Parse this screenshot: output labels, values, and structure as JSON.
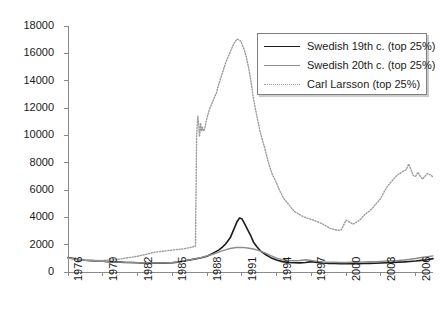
{
  "chart_data": {
    "type": "line",
    "title": "",
    "xlabel": "",
    "ylabel": "",
    "xlim": [
      1976,
      2007.5
    ],
    "ylim": [
      0,
      18000
    ],
    "grid": false,
    "legend_position": "top-right",
    "y_ticks": [
      0,
      2000,
      4000,
      6000,
      8000,
      10000,
      12000,
      14000,
      16000,
      18000
    ],
    "y_tick_labels": [
      "0",
      "2000",
      "4000",
      "6000",
      "8000",
      "10000",
      "12000",
      "14000",
      "16000",
      "18000"
    ],
    "x_ticks": [
      1976,
      1979,
      1982,
      1985,
      1988,
      1991,
      1994,
      1997,
      2000,
      2003,
      2006
    ],
    "x_tick_labels": [
      "1976",
      "1979",
      "1982",
      "1985",
      "1988",
      "1991",
      "1994",
      "1997",
      "2000",
      "2003",
      "2006"
    ],
    "series": [
      {
        "name": "Swedish 19th c. (top 25%)",
        "style": "solid",
        "color": "#1c1c1c",
        "width": 1.6,
        "x": [
          1976.0,
          1976.5,
          1977.0,
          1977.5,
          1978.0,
          1978.5,
          1979.0,
          1979.5,
          1980.0,
          1980.5,
          1981.0,
          1981.5,
          1982.0,
          1982.5,
          1983.0,
          1983.5,
          1984.0,
          1984.5,
          1985.0,
          1985.5,
          1986.0,
          1986.5,
          1987.0,
          1987.3,
          1987.6,
          1988.0,
          1988.3,
          1988.6,
          1989.0,
          1989.3,
          1989.6,
          1990.0,
          1990.2,
          1990.4,
          1990.6,
          1990.8,
          1991.0,
          1991.2,
          1991.5,
          1991.8,
          1992.0,
          1992.3,
          1992.6,
          1993.0,
          1993.5,
          1994.0,
          1994.5,
          1995.0,
          1995.5,
          1996.0,
          1996.5,
          1997.0,
          1997.5,
          1998.0,
          1998.5,
          1999.0,
          1999.5,
          2000.0,
          2000.5,
          2001.0,
          2001.5,
          2002.0,
          2002.5,
          2003.0,
          2003.5,
          2004.0,
          2004.5,
          2005.0,
          2005.5,
          2006.0,
          2006.5,
          2007.0,
          2007.5
        ],
        "y": [
          1050,
          980,
          900,
          860,
          830,
          800,
          790,
          760,
          740,
          720,
          700,
          690,
          680,
          670,
          660,
          650,
          650,
          660,
          680,
          720,
          800,
          880,
          960,
          1000,
          1060,
          1150,
          1280,
          1420,
          1600,
          1800,
          2050,
          2500,
          2900,
          3300,
          3700,
          3950,
          3900,
          3600,
          3100,
          2600,
          2200,
          1850,
          1550,
          1300,
          1050,
          880,
          760,
          700,
          680,
          670,
          700,
          760,
          700,
          660,
          630,
          620,
          610,
          600,
          600,
          610,
          620,
          630,
          640,
          660,
          680,
          700,
          720,
          740,
          770,
          800,
          850,
          900,
          980
        ],
        "peak": {
          "x": 1990.8,
          "y": 3950
        }
      },
      {
        "name": "Swedish 20th c. (top 25%)",
        "style": "solid",
        "color": "#8c8c8c",
        "width": 1.4,
        "x": [
          1976.0,
          1976.5,
          1977.0,
          1977.5,
          1978.0,
          1978.5,
          1979.0,
          1979.5,
          1980.0,
          1980.5,
          1981.0,
          1981.5,
          1982.0,
          1982.5,
          1983.0,
          1983.5,
          1984.0,
          1984.5,
          1985.0,
          1985.5,
          1986.0,
          1986.5,
          1987.0,
          1987.5,
          1988.0,
          1988.5,
          1989.0,
          1989.5,
          1990.0,
          1990.5,
          1991.0,
          1991.5,
          1992.0,
          1992.5,
          1993.0,
          1993.5,
          1994.0,
          1994.5,
          1995.0,
          1995.5,
          1996.0,
          1996.5,
          1997.0,
          1997.5,
          1998.0,
          1998.5,
          1999.0,
          1999.5,
          2000.0,
          2000.5,
          2001.0,
          2001.5,
          2002.0,
          2002.5,
          2003.0,
          2003.5,
          2004.0,
          2004.5,
          2005.0,
          2005.5,
          2006.0,
          2006.5,
          2007.0,
          2007.5
        ],
        "y": [
          1050,
          960,
          880,
          850,
          820,
          800,
          780,
          760,
          740,
          720,
          705,
          695,
          685,
          675,
          665,
          660,
          660,
          670,
          690,
          730,
          810,
          890,
          970,
          1060,
          1180,
          1300,
          1450,
          1600,
          1720,
          1790,
          1800,
          1760,
          1680,
          1560,
          1400,
          1200,
          1020,
          900,
          840,
          820,
          840,
          900,
          840,
          780,
          740,
          720,
          710,
          700,
          700,
          710,
          720,
          730,
          745,
          760,
          780,
          800,
          820,
          840,
          880,
          930,
          990,
          1060,
          1120,
          1180
        ],
        "peak": {
          "x": 1991.0,
          "y": 1800
        }
      },
      {
        "name": "Carl Larsson (top 25%)",
        "style": "dotted",
        "color": "#9a9a9a",
        "width": 1.4,
        "x": [
          1976.0,
          1976.5,
          1977.0,
          1977.5,
          1978.0,
          1978.5,
          1979.0,
          1979.5,
          1980.0,
          1980.5,
          1981.0,
          1981.5,
          1982.0,
          1982.5,
          1983.0,
          1983.5,
          1984.0,
          1984.5,
          1985.0,
          1985.5,
          1986.0,
          1986.5,
          1986.8,
          1987.0,
          1987.05,
          1987.1,
          1987.2,
          1987.3,
          1987.35,
          1987.45,
          1987.5,
          1987.6,
          1987.7,
          1987.8,
          1987.9,
          1988.0,
          1988.2,
          1988.5,
          1988.8,
          1989.0,
          1989.3,
          1989.6,
          1990.0,
          1990.3,
          1990.6,
          1990.9,
          1991.0,
          1991.2,
          1991.4,
          1991.6,
          1991.8,
          1992.0,
          1992.3,
          1992.6,
          1993.0,
          1993.3,
          1993.6,
          1994.0,
          1994.3,
          1994.6,
          1995.0,
          1995.3,
          1995.6,
          1996.0,
          1996.3,
          1996.6,
          1997.0,
          1997.3,
          1997.6,
          1998.0,
          1998.3,
          1998.6,
          1999.0,
          1999.3,
          1999.6,
          2000.0,
          2000.3,
          2000.6,
          2001.0,
          2001.3,
          2001.6,
          2002.0,
          2002.3,
          2002.6,
          2003.0,
          2003.3,
          2003.6,
          2004.0,
          2004.3,
          2004.6,
          2005.0,
          2005.2,
          2005.4,
          2005.6,
          2005.8,
          2006.0,
          2006.2,
          2006.4,
          2006.6,
          2006.8,
          2007.0,
          2007.3,
          2007.5
        ],
        "y": [
          1000,
          950,
          900,
          880,
          860,
          850,
          850,
          870,
          900,
          950,
          1020,
          1080,
          1150,
          1250,
          1350,
          1450,
          1500,
          1550,
          1600,
          1650,
          1700,
          1780,
          1850,
          1900,
          6000,
          9900,
          11400,
          10600,
          9900,
          10900,
          10300,
          10600,
          10300,
          10500,
          10900,
          11300,
          11900,
          12500,
          13100,
          13700,
          14500,
          15300,
          16100,
          16700,
          17050,
          16900,
          16700,
          16300,
          15700,
          14900,
          13900,
          12700,
          11400,
          10200,
          9000,
          8000,
          7200,
          6500,
          5900,
          5400,
          5000,
          4650,
          4400,
          4200,
          4050,
          3950,
          3850,
          3750,
          3650,
          3500,
          3350,
          3200,
          3100,
          3050,
          3100,
          3800,
          3650,
          3500,
          3700,
          3900,
          4200,
          4450,
          4700,
          5000,
          5400,
          5900,
          6300,
          6700,
          7000,
          7200,
          7400,
          7500,
          7900,
          7500,
          7050,
          7000,
          7300,
          7000,
          6800,
          7000,
          7200,
          7100,
          6950
        ],
        "peak": {
          "x": 1990.6,
          "y": 17050
        }
      }
    ]
  },
  "legend": {
    "items": [
      {
        "label": "Swedish 19th c. (top 25%)",
        "style": "solid",
        "color": "#1c1c1c"
      },
      {
        "label": "Swedish 20th c. (top 25%)",
        "style": "solid",
        "color": "#8c8c8c"
      },
      {
        "label": "Carl Larsson (top 25%)",
        "style": "dotted",
        "color": "#9a9a9a"
      }
    ]
  },
  "axes": {
    "axis_color": "#8a8a8a",
    "tick_color": "#8a8a8a",
    "label_color": "#1a1a1a"
  }
}
